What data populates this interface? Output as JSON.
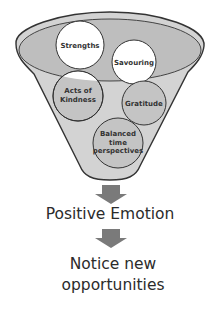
{
  "diagram": {
    "type": "funnel-flow",
    "funnel": {
      "colors": {
        "outline": "#333333",
        "rim_fill": "#d6d6d6",
        "inner_ellipse_fill": "#bebebe",
        "body_fill": "#d3d3d3",
        "circle_white": "#ffffff",
        "circle_gray": "#c4c4c4"
      },
      "items": [
        {
          "id": "strengths",
          "lines": [
            "Strengths"
          ]
        },
        {
          "id": "savouring",
          "lines": [
            "Savouring"
          ]
        },
        {
          "id": "acts-of-kindness",
          "lines": [
            "Acts of",
            "Kindness"
          ]
        },
        {
          "id": "gratitude",
          "lines": [
            "Gratitude"
          ]
        },
        {
          "id": "balanced-time-perspectives",
          "lines": [
            "Balanced",
            "time",
            "perspectives"
          ]
        }
      ]
    },
    "arrow_color": "#7a7a7a",
    "steps": [
      {
        "lines": [
          "Positive Emotion"
        ]
      },
      {
        "lines": [
          "Notice new",
          "opportunities"
        ]
      }
    ]
  }
}
